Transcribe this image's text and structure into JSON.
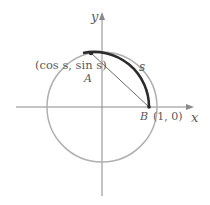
{
  "diagram": {
    "axes": {
      "x_label": "x",
      "y_label": "y"
    },
    "points": {
      "A": {
        "label": "A",
        "coords_label": "(cos s, sin s)"
      },
      "B": {
        "label": "B",
        "coords_label": "(1, 0)"
      }
    },
    "arc_label": "s",
    "colors": {
      "axis": "#8a8a8a",
      "circle": "#b0b0b0",
      "arc": "#2b2b2b",
      "chord": "#6a6a6a",
      "text": "#5a5a5a"
    }
  }
}
